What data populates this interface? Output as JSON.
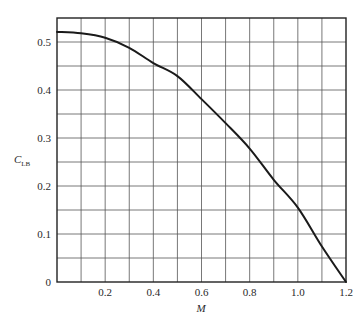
{
  "chart_data": {
    "type": "line",
    "title": "",
    "xlabel": "M",
    "ylabel": "C",
    "ylabel_subscript": "LB",
    "xlim": [
      0,
      1.2
    ],
    "ylim": [
      0,
      0.55
    ],
    "x_ticks": [
      0.2,
      0.4,
      0.6,
      0.8,
      1.0,
      1.2
    ],
    "x_tick_labels": [
      "0.2",
      "0.4",
      "0.6",
      "0.8",
      "1.0",
      "1.2"
    ],
    "y_ticks": [
      0,
      0.1,
      0.2,
      0.3,
      0.4,
      0.5
    ],
    "y_tick_labels": [
      "0",
      "0.1",
      "0.2",
      "0.3",
      "0.4",
      "0.5"
    ],
    "x_grid_step": 0.1,
    "y_grid_step": 0.05,
    "grid": true,
    "legend": null,
    "series": [
      {
        "name": "C_LB vs M",
        "x": [
          0.0,
          0.1,
          0.2,
          0.3,
          0.4,
          0.5,
          0.6,
          0.7,
          0.8,
          0.9,
          1.0,
          1.1,
          1.2
        ],
        "y": [
          0.521,
          0.518,
          0.509,
          0.488,
          0.456,
          0.429,
          0.381,
          0.331,
          0.278,
          0.213,
          0.155,
          0.074,
          0.0
        ]
      }
    ],
    "colors": {
      "line": "#1a1a1a",
      "grid": "#555555",
      "frame": "#222222",
      "text": "#2a2a2a"
    }
  }
}
